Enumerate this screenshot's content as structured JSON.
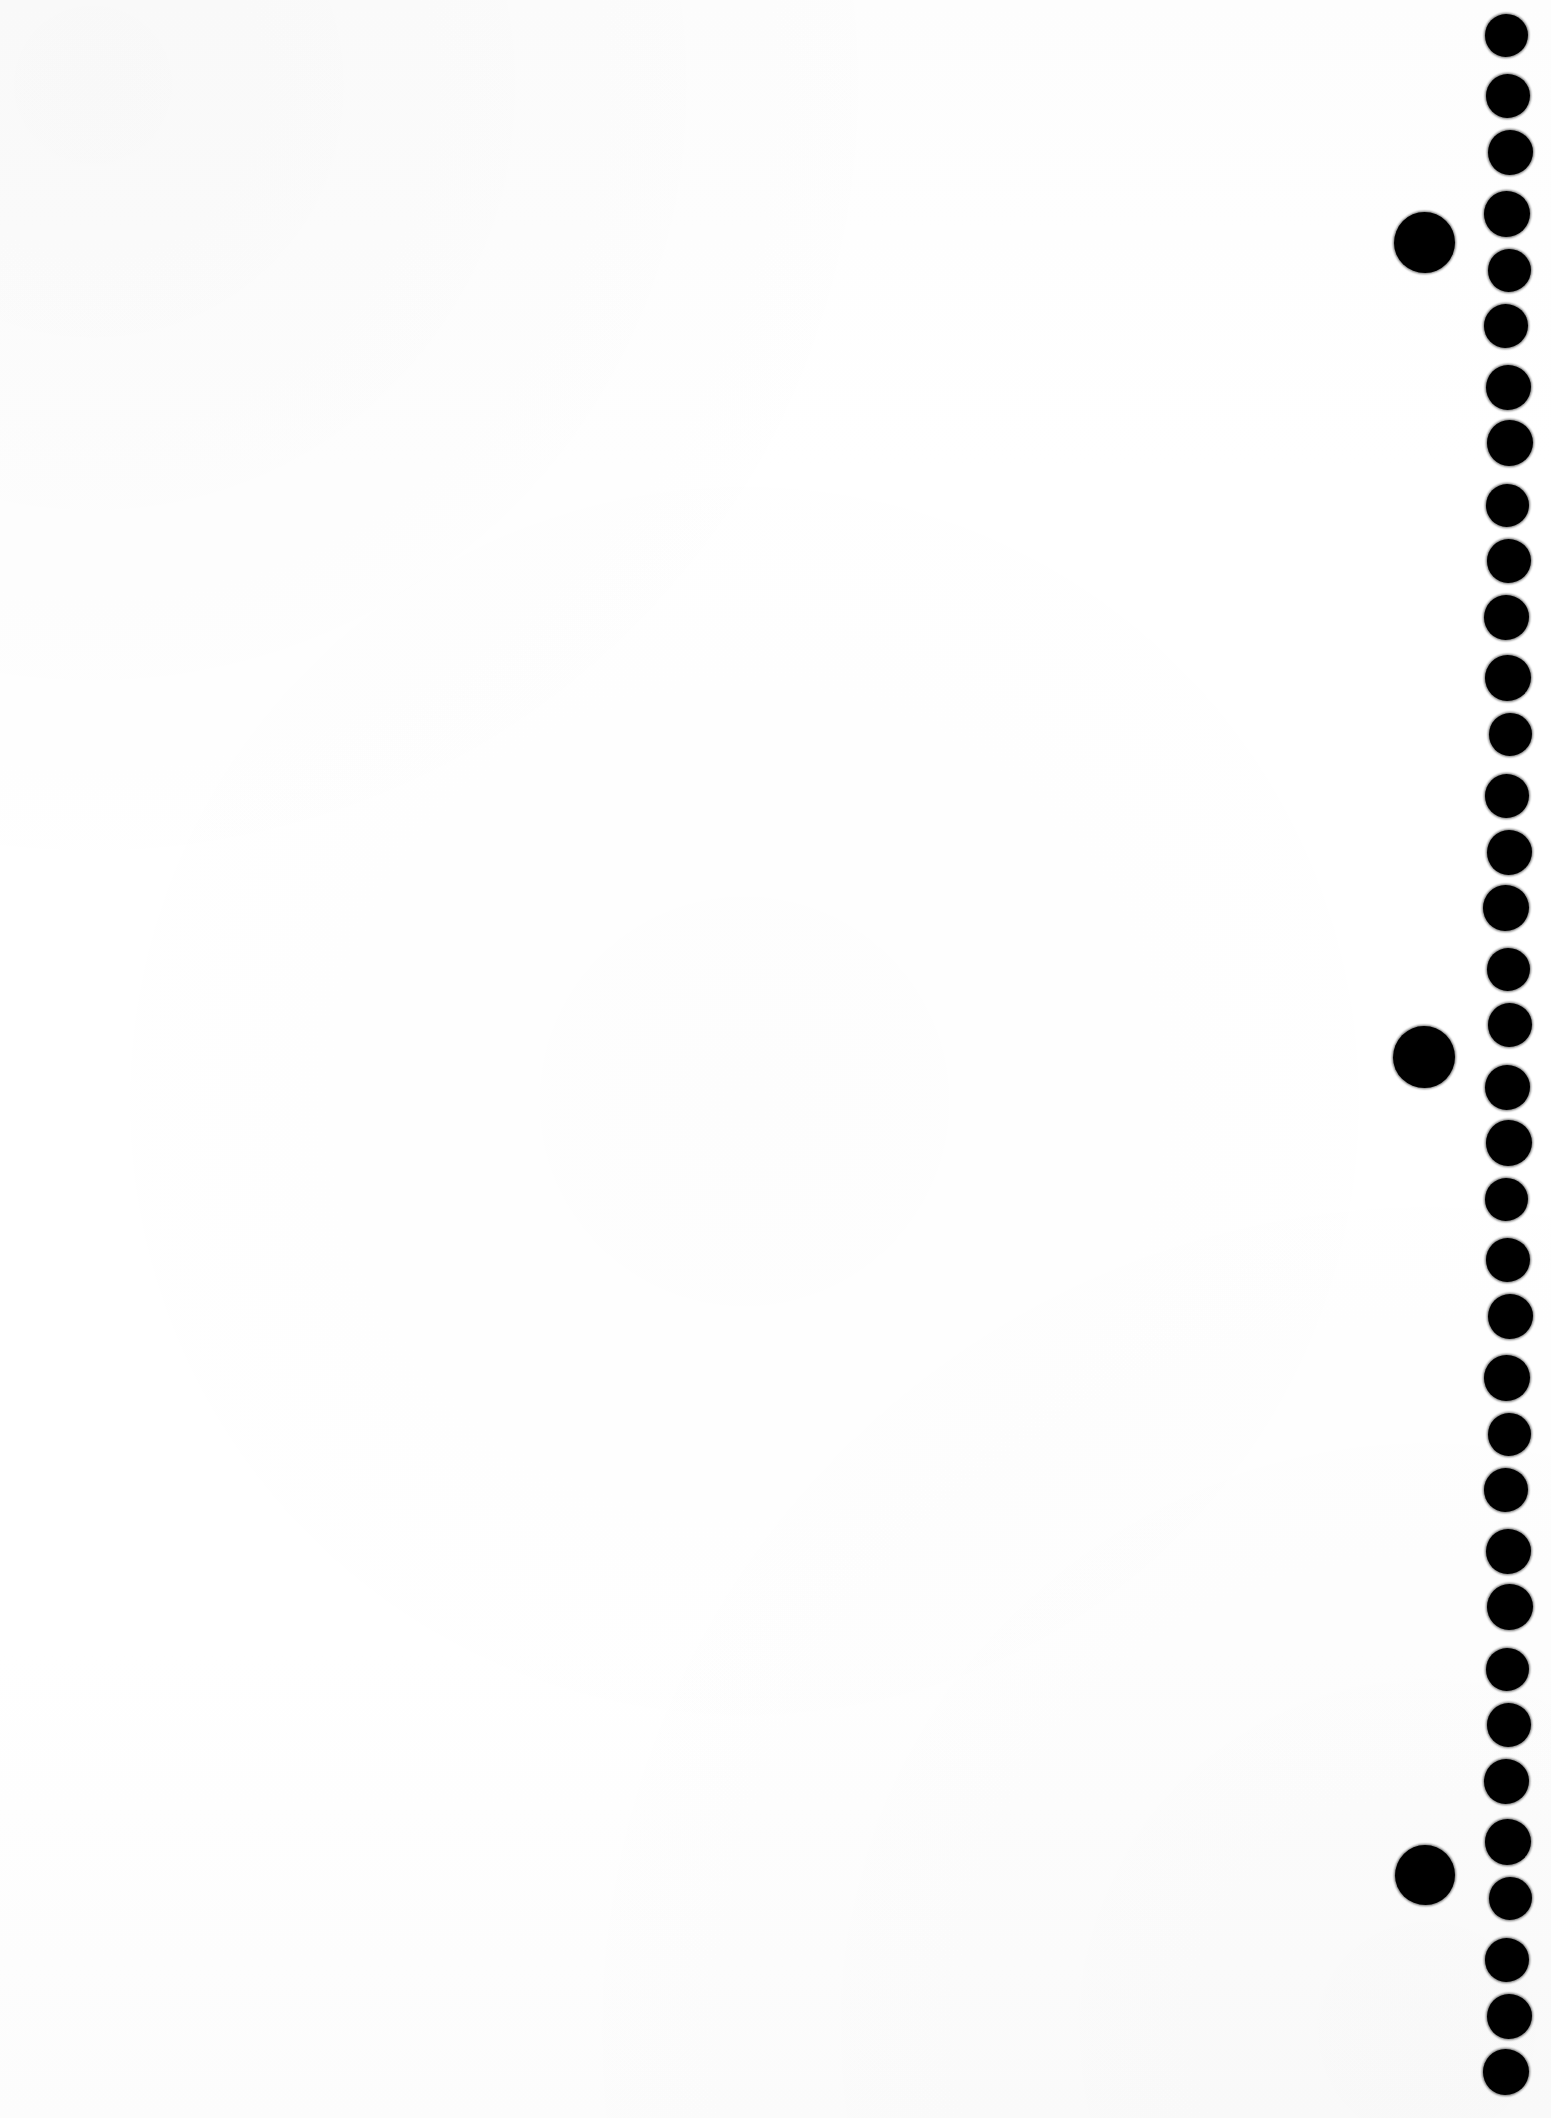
{
  "page": {
    "width": 1551,
    "height": 2118,
    "background_color": "#ffffff",
    "ink_color": "#000000",
    "orientation": "portrait",
    "visible_text": ""
  },
  "blank_field": {
    "label": "",
    "description": "Empty white page area"
  },
  "dot_column": {
    "name": "registration-dot-column",
    "count": 36,
    "dot_diameter": 44,
    "center_x": 1508,
    "first_center_y": 37,
    "spacing": 58.2,
    "color": "#000000",
    "centers_y": [
      37,
      95,
      153,
      212,
      270,
      328,
      386,
      444,
      503,
      561,
      619,
      677,
      735,
      794,
      852,
      910,
      968,
      1026,
      1085,
      1143,
      1201,
      1259,
      1317,
      1376,
      1434,
      1492,
      1550,
      1608,
      1667,
      1725,
      1783,
      1841,
      1899,
      1958,
      2016,
      2074
    ]
  },
  "marker_dots": {
    "name": "large-marker-dots",
    "count": 3,
    "dot_diameter": 61,
    "center_x": 1424,
    "color": "#000000",
    "items": [
      {
        "label": "marker-1",
        "cx": 1424,
        "cy": 242,
        "d": 61
      },
      {
        "label": "marker-2",
        "cx": 1424,
        "cy": 1057,
        "d": 62
      },
      {
        "label": "marker-3",
        "cx": 1425,
        "cy": 1875,
        "d": 60
      }
    ]
  }
}
